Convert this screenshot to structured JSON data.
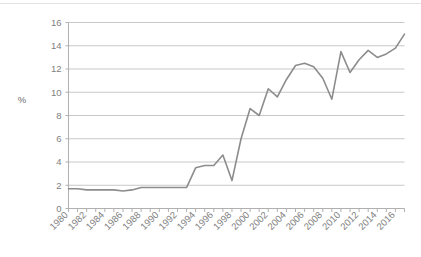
{
  "chart_data": {
    "type": "line",
    "title": "",
    "subtitle": "",
    "xlabel": "",
    "ylabel": "%",
    "ylim": [
      0,
      16
    ],
    "xlim": [
      1980,
      2017
    ],
    "yticks": [
      0,
      2,
      4,
      6,
      8,
      10,
      12,
      14,
      16
    ],
    "ytick_labels": [
      "0",
      "2",
      "4",
      "6",
      "8",
      "10",
      "12",
      "14",
      "16"
    ],
    "xticks": [
      1980,
      1982,
      1984,
      1986,
      1988,
      1990,
      1992,
      1994,
      1996,
      1998,
      2000,
      2002,
      2004,
      2006,
      2008,
      2010,
      2012,
      2014,
      2016
    ],
    "xtick_labels": [
      "1980",
      "1982",
      "1984",
      "1986",
      "1988",
      "1990",
      "1992",
      "1994",
      "1996",
      "1998",
      "2000",
      "2002",
      "2004",
      "2006",
      "2008",
      "2010",
      "2012",
      "2014",
      "2016"
    ],
    "grid": true,
    "grid_axis": "y",
    "legend": false,
    "legend_position": "none",
    "line_color": "#8c8c8c",
    "grid_color": "#c8c8c8",
    "axis_color": "#b0b0b0",
    "tick_label_color": "#808080",
    "x": [
      1980,
      1981,
      1982,
      1983,
      1984,
      1985,
      1986,
      1987,
      1988,
      1989,
      1990,
      1991,
      1992,
      1993,
      1994,
      1995,
      1996,
      1997,
      1998,
      1999,
      2000,
      2001,
      2002,
      2003,
      2004,
      2005,
      2006,
      2007,
      2008,
      2009,
      2010,
      2011,
      2012,
      2013,
      2014,
      2015,
      2016,
      2017
    ],
    "values": [
      1.7,
      1.7,
      1.6,
      1.6,
      1.6,
      1.6,
      1.5,
      1.6,
      1.8,
      1.8,
      1.8,
      1.8,
      1.8,
      1.8,
      3.5,
      3.7,
      3.7,
      4.6,
      2.4,
      6.0,
      8.6,
      8.0,
      10.3,
      9.6,
      11.1,
      12.3,
      12.5,
      12.2,
      11.2,
      9.4,
      13.5,
      11.7,
      12.8,
      13.6,
      13.0,
      13.3,
      13.8,
      15.0
    ],
    "series_name": ""
  }
}
